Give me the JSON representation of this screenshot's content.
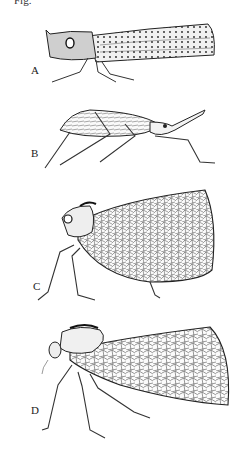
{
  "caption": "Fig.",
  "panels": [
    {
      "label": "A",
      "subject": "planthopper-lateral-spotted-wing"
    },
    {
      "label": "B",
      "subject": "elongate-planthopper-lateral"
    },
    {
      "label": "C",
      "subject": "broad-wing-planthopper-lateral"
    },
    {
      "label": "D",
      "subject": "planthopper-lateral-reticulate-wing"
    }
  ],
  "colors": {
    "ink": "#222222",
    "background": "#ffffff"
  }
}
